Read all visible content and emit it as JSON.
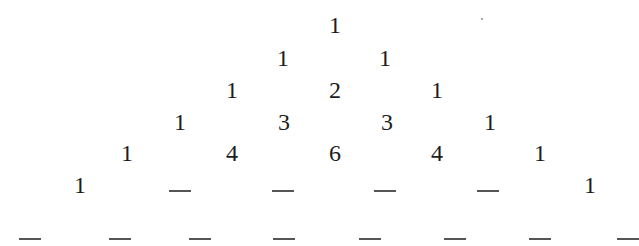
{
  "figure": {
    "rows": [
      {
        "index": 0,
        "y": 25,
        "entries": [
          {
            "x": 335,
            "value": "1"
          }
        ]
      },
      {
        "index": 1,
        "y": 58,
        "entries": [
          {
            "x": 283,
            "value": "1"
          },
          {
            "x": 385,
            "value": "1"
          }
        ]
      },
      {
        "index": 2,
        "y": 90,
        "entries": [
          {
            "x": 232,
            "value": "1"
          },
          {
            "x": 335,
            "value": "2"
          },
          {
            "x": 437,
            "value": "1"
          }
        ]
      },
      {
        "index": 3,
        "y": 122,
        "entries": [
          {
            "x": 180,
            "value": "1"
          },
          {
            "x": 284,
            "value": "3"
          },
          {
            "x": 387,
            "value": "3"
          },
          {
            "x": 490,
            "value": "1"
          }
        ]
      },
      {
        "index": 4,
        "y": 153,
        "entries": [
          {
            "x": 127,
            "value": "1"
          },
          {
            "x": 232,
            "value": "4"
          },
          {
            "x": 335,
            "value": "6"
          },
          {
            "x": 437,
            "value": "4"
          },
          {
            "x": 540,
            "value": "1"
          }
        ]
      },
      {
        "index": 5,
        "y": 185,
        "entries": [
          {
            "x": 80,
            "value": "1"
          },
          {
            "x": 180,
            "value": "",
            "blank": true
          },
          {
            "x": 283,
            "value": "",
            "blank": true
          },
          {
            "x": 385,
            "value": "",
            "blank": true
          },
          {
            "x": 488,
            "value": "",
            "blank": true
          },
          {
            "x": 590,
            "value": "1"
          }
        ]
      },
      {
        "index": 6,
        "y": 233,
        "entries": [
          {
            "x": 30,
            "value": "",
            "blank": true
          },
          {
            "x": 120,
            "value": "",
            "blank": true
          },
          {
            "x": 200,
            "value": "",
            "blank": true
          },
          {
            "x": 284,
            "value": "",
            "blank": true
          },
          {
            "x": 370,
            "value": "",
            "blank": true
          },
          {
            "x": 455,
            "value": "",
            "blank": true
          },
          {
            "x": 540,
            "value": "",
            "blank": true
          },
          {
            "x": 628,
            "value": "",
            "blank": true
          }
        ]
      }
    ],
    "blank_symbol": "_",
    "colors": {
      "text": "#1c1c1c",
      "blank_line": "#555555",
      "background": "#ffffff"
    }
  }
}
